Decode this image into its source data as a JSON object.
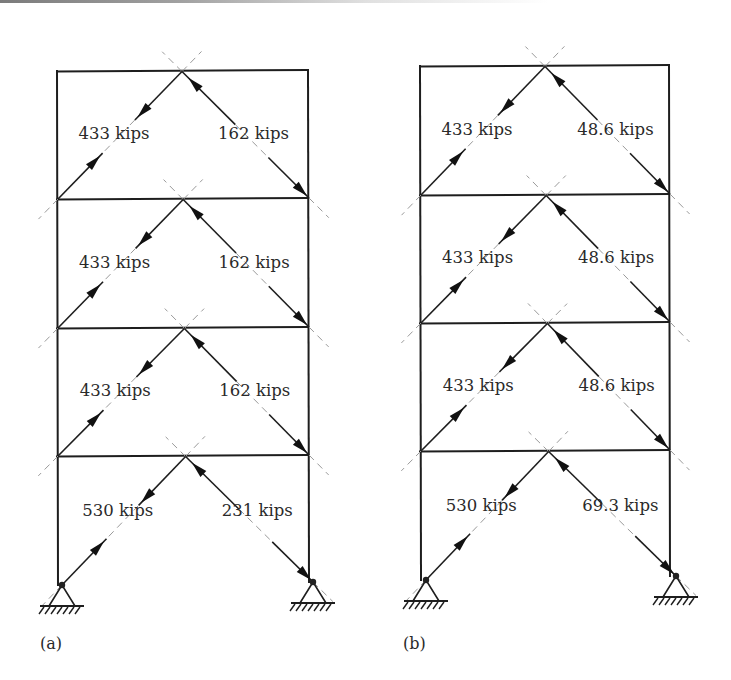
{
  "figure": {
    "colors": {
      "line": "#1e1e1e",
      "dash": "#9a9a9a",
      "text": "#2a2a2a",
      "background": "#ffffff"
    },
    "frames": [
      {
        "id": "a",
        "panel_label": "(a)",
        "panel_label_pos": [
          40,
          649
        ],
        "left_x": 57,
        "right_x": 308,
        "apex_x": 182,
        "beam_y": [
          71,
          199,
          328,
          456
        ],
        "base_y": [
          585,
          582
        ],
        "support_x": [
          62,
          313
        ],
        "stories": [
          {
            "left_force": "433 kips",
            "right_force": "162 kips"
          },
          {
            "left_force": "433 kips",
            "right_force": "162 kips"
          },
          {
            "left_force": "433 kips",
            "right_force": "162 kips"
          },
          {
            "left_force": "530 kips",
            "right_force": "231 kips"
          }
        ]
      },
      {
        "id": "b",
        "panel_label": "(b)",
        "panel_label_pos": [
          403,
          649
        ],
        "left_x": 420,
        "right_x": 669,
        "apex_x": 545,
        "beam_y": [
          66,
          195,
          323,
          451
        ],
        "base_y": [
          580,
          576
        ],
        "support_x": [
          426,
          676
        ],
        "stories": [
          {
            "left_force": "433 kips",
            "right_force": "48.6 kips"
          },
          {
            "left_force": "433 kips",
            "right_force": "48.6 kips"
          },
          {
            "left_force": "433 kips",
            "right_force": "48.6 kips"
          },
          {
            "left_force": "530 kips",
            "right_force": "69.3 kips"
          }
        ]
      }
    ]
  }
}
